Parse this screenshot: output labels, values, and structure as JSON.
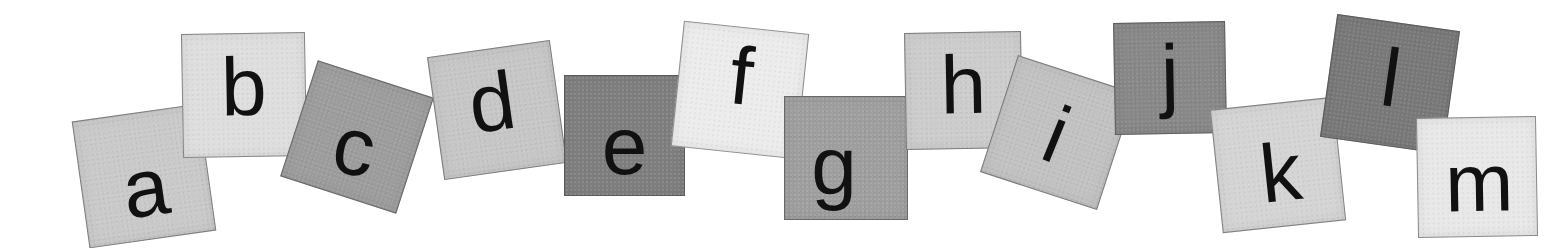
{
  "image": {
    "description": "Alphabet letters a through m on rotated gray paper squares",
    "background": "#ffffff",
    "tiles": [
      {
        "letter": "a",
        "shade": "#c9c9c9",
        "x": 80,
        "y": 112,
        "size": 128,
        "rot": -8,
        "lx": 0,
        "ly": 12,
        "lrot": 0
      },
      {
        "letter": "b",
        "shade": "#dedede",
        "x": 182,
        "y": 33,
        "size": 124,
        "rot": -1,
        "lx": 0,
        "ly": -8,
        "lrot": 0
      },
      {
        "letter": "c",
        "shade": "#9c9c9c",
        "x": 296,
        "y": 76,
        "size": 122,
        "rot": 18,
        "lx": 0,
        "ly": 10,
        "lrot": -8
      },
      {
        "letter": "d",
        "shade": "#c6c6c6",
        "x": 435,
        "y": 48,
        "size": 124,
        "rot": -8,
        "lx": -4,
        "ly": -8,
        "lrot": 0
      },
      {
        "letter": "e",
        "shade": "#7e7e7e",
        "x": 564,
        "y": 75,
        "size": 121,
        "rot": 0,
        "lx": 0,
        "ly": 10,
        "lrot": 0
      },
      {
        "letter": "f",
        "shade": "#ececec",
        "x": 677,
        "y": 27,
        "size": 126,
        "rot": 6,
        "lx": 0,
        "ly": -14,
        "lrot": 0
      },
      {
        "letter": "g",
        "shade": "#9e9e9e",
        "x": 784,
        "y": 96,
        "size": 124,
        "rot": 0,
        "lx": -12,
        "ly": 8,
        "lrot": 0
      },
      {
        "letter": "h",
        "shade": "#cccccc",
        "x": 905,
        "y": 32,
        "size": 117,
        "rot": -1,
        "lx": 0,
        "ly": -6,
        "lrot": 0
      },
      {
        "letter": "i",
        "shade": "#c1c1c1",
        "x": 996,
        "y": 71,
        "size": 123,
        "rot": 18,
        "lx": 0,
        "ly": 2,
        "lrot": 4
      },
      {
        "letter": "j",
        "shade": "#878787",
        "x": 1114,
        "y": 22,
        "size": 112,
        "rot": -1,
        "lx": 0,
        "ly": -4,
        "lrot": 0
      },
      {
        "letter": "k",
        "shade": "#d4d4d4",
        "x": 1216,
        "y": 103,
        "size": 124,
        "rot": -6,
        "lx": 2,
        "ly": 8,
        "lrot": 0
      },
      {
        "letter": "l",
        "shade": "#787878",
        "x": 1328,
        "y": 22,
        "size": 124,
        "rot": 8,
        "lx": 0,
        "ly": -6,
        "lrot": 0
      },
      {
        "letter": "m",
        "shade": "#e8e8e8",
        "x": 1417,
        "y": 117,
        "size": 120,
        "rot": -1,
        "lx": 2,
        "ly": 6,
        "lrot": 0
      }
    ]
  }
}
